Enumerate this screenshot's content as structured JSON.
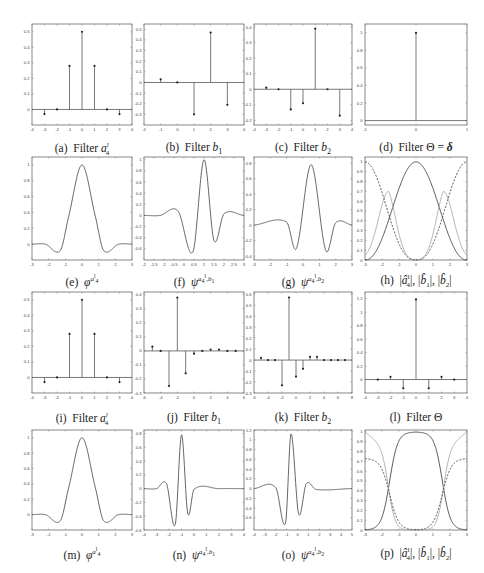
{
  "figure": {
    "panels": [
      {
        "id": "a",
        "caption": "(a) Filter a⁴ˡ",
        "caption_html": "(a)&nbsp; Filter <i>a</i><sup style='font-size:7px'><i>l</i></sup><sub style='font-size:7px;margin-left:-3px'>4</sub>"
      },
      {
        "id": "b",
        "caption": "(b) Filter b1",
        "caption_html": "(b)&nbsp; Filter <i>b</i><sub style='font-size:8px'>1</sub>"
      },
      {
        "id": "c",
        "caption": "(c) Filter b2",
        "caption_html": "(c)&nbsp; Filter <i>b</i><sub style='font-size:8px'>2</sub>"
      },
      {
        "id": "d",
        "caption": "(d) Filter Θ = δ",
        "caption_html": "(d)&nbsp; Filter &Theta; = <b><i>&delta;</i></b>"
      },
      {
        "id": "e",
        "caption": "(e) ϕ^{a_4^l}",
        "caption_html": "(e)&nbsp; <i>&phi;</i><sup style='font-size:7px'><i>a</i><sup>l</sup><sub>4</sub></sup>"
      },
      {
        "id": "f",
        "caption": "(f) ψ^{a_4^l, b_1}",
        "caption_html": "(f)&nbsp; <i>&psi;</i><sup style='font-size:7px'><i>a</i><sub>4</sub><sup>l</sup>,<i>b</i><sub>1</sub></sup>"
      },
      {
        "id": "g",
        "caption": "(g) ψ^{a_4^l, b_2}",
        "caption_html": "(g)&nbsp; <i>&psi;</i><sup style='font-size:7px'><i>a</i><sub>4</sub><sup>l</sup>,<i>b</i><sub>2</sub></sup>"
      },
      {
        "id": "h",
        "caption": "(h) |â_4^l|, |b̂_1|, |b̂_2|",
        "caption_html": "(h)&nbsp; |<i>a&#770;</i><sup style='font-size:7px'>l</sup><sub style='font-size:7px;margin-left:-3px'>4</sub>|, |<i>b&#770;</i><sub style='font-size:7px'>1</sub>|, |<i>b&#770;</i><sub style='font-size:7px'>2</sub>|"
      },
      {
        "id": "i",
        "caption": "(i) Filter a⁴ˡ",
        "caption_html": "(i)&nbsp; Filter <i>a</i><sup style='font-size:7px'><i>l</i></sup><sub style='font-size:7px;margin-left:-3px'>4</sub>"
      },
      {
        "id": "j",
        "caption": "(j) Filter b1",
        "caption_html": "(j)&nbsp; Filter <i>b</i><sub style='font-size:8px'>1</sub>"
      },
      {
        "id": "k",
        "caption": "(k) Filter b2",
        "caption_html": "(k)&nbsp; Filter <i>b</i><sub style='font-size:8px'>2</sub>"
      },
      {
        "id": "l",
        "caption": "(l) Filter Θ",
        "caption_html": "(l)&nbsp; Filter &Theta;"
      },
      {
        "id": "m",
        "caption": "(m) ϕ^{a_4^l}",
        "caption_html": "(m)&nbsp; <i>&phi;</i><sup style='font-size:7px'><i>a</i><sup>l</sup><sub>4</sub></sup>"
      },
      {
        "id": "n",
        "caption": "(n) ψ^{a_4^l, b_1}",
        "caption_html": "(n)&nbsp; <i>&psi;</i><sup style='font-size:7px'><i>a</i><sub>4</sub><sup>l</sup>,<i>b</i><sub>1</sub></sup>"
      },
      {
        "id": "o",
        "caption": "(o) ψ^{a_4^l, b_2}",
        "caption_html": "(o)&nbsp; <i>&psi;</i><sup style='font-size:7px'><i>a</i><sub>4</sub><sup>l</sup>,<i>b</i><sub>2</sub></sup>"
      },
      {
        "id": "p",
        "caption": "(p) |â_4^l|, |b̂_1|, |b̂_2|",
        "caption_html": "(p)&nbsp; |<i>a&#770;</i><sup style='font-size:7px'>l</sup><sub style='font-size:7px;margin-left:-3px'>4</sub>|, |<i>b&#770;</i><sub style='font-size:7px'>1</sub>|, |<i>b&#770;</i><sub style='font-size:7px'>2</sub>|"
      }
    ]
  },
  "chart_data": [
    {
      "id": "a",
      "type": "stem",
      "title": "Filter a_4^l",
      "x": [
        -3,
        -2,
        -1,
        0,
        1,
        2,
        3
      ],
      "values": [
        -0.03,
        0,
        0.28,
        0.5,
        0.28,
        0,
        -0.03
      ],
      "xlim": [
        -4,
        4
      ],
      "ylim": [
        -0.1,
        0.55
      ],
      "xticks": [
        -4,
        -3,
        -2,
        -1,
        0,
        1,
        2,
        3,
        4
      ],
      "yticks": [
        0,
        0.1,
        0.2,
        0.3,
        0.4,
        0.5
      ]
    },
    {
      "id": "b",
      "type": "stem",
      "title": "Filter b_1",
      "x": [
        -1,
        0,
        1,
        2,
        3
      ],
      "values": [
        0.03,
        0,
        -0.3,
        0.47,
        -0.21
      ],
      "xlim": [
        -2,
        4
      ],
      "ylim": [
        -0.4,
        0.55
      ],
      "xticks": [
        -2,
        -1,
        0,
        1,
        2,
        3,
        4
      ],
      "yticks": [
        -0.3,
        -0.2,
        -0.1,
        0,
        0.1,
        0.2,
        0.3,
        0.4,
        0.5
      ]
    },
    {
      "id": "c",
      "type": "stem",
      "title": "Filter b_2",
      "x": [
        -3,
        -2,
        -1,
        0,
        1,
        2,
        3
      ],
      "values": [
        0.01,
        0,
        -0.13,
        -0.09,
        0.39,
        0,
        -0.17
      ],
      "xlim": [
        -4,
        4
      ],
      "ylim": [
        -0.23,
        0.42
      ],
      "xticks": [
        -4,
        -3,
        -2,
        -1,
        0,
        1,
        2,
        3,
        4
      ],
      "yticks": [
        -0.2,
        -0.1,
        0,
        0.1,
        0.2,
        0.3,
        0.4
      ]
    },
    {
      "id": "d",
      "type": "stem",
      "title": "Filter Θ = δ",
      "x": [
        0
      ],
      "values": [
        1
      ],
      "xlim": [
        -1,
        1
      ],
      "ylim": [
        -0.05,
        1.1
      ],
      "xticks": [
        -1,
        0,
        1
      ],
      "yticks": [
        0,
        0.2,
        0.4,
        0.6,
        0.8,
        1
      ]
    },
    {
      "id": "e",
      "type": "line",
      "title": "ϕ^{a_4^l}",
      "xlim": [
        -3,
        3
      ],
      "ylim": [
        -0.2,
        1.1
      ],
      "xticks": [
        -3,
        -2,
        -1,
        0,
        1,
        2,
        3
      ],
      "yticks": [
        0,
        0.2,
        0.4,
        0.6,
        0.8,
        1
      ],
      "key_points": [
        [
          -3,
          0
        ],
        [
          -2.2,
          0
        ],
        [
          -1.3,
          -0.08
        ],
        [
          -0.8,
          0.35
        ],
        [
          0,
          1
        ],
        [
          0.8,
          0.35
        ],
        [
          1.3,
          -0.08
        ],
        [
          2.2,
          0
        ],
        [
          3,
          0
        ]
      ]
    },
    {
      "id": "f",
      "type": "line",
      "title": "ψ^{a_4^l,b_1}",
      "xlim": [
        -2,
        3
      ],
      "ylim": [
        -0.8,
        1.05
      ],
      "xticks": [
        -2,
        -1.5,
        -1,
        -0.5,
        0,
        0.5,
        1,
        1.5,
        2,
        2.5,
        3
      ],
      "yticks": [
        -0.6,
        -0.4,
        -0.2,
        0,
        0.2,
        0.4,
        0.6,
        0.8,
        1
      ],
      "key_points": [
        [
          -2,
          0
        ],
        [
          -1.2,
          0
        ],
        [
          -0.3,
          0.08
        ],
        [
          0.45,
          -0.65
        ],
        [
          1,
          1
        ],
        [
          1.5,
          -0.45
        ],
        [
          2,
          0.03
        ],
        [
          3,
          0
        ]
      ]
    },
    {
      "id": "g",
      "type": "line",
      "title": "ψ^{a_4^l,b_2}",
      "xlim": [
        -3,
        3
      ],
      "ylim": [
        -0.45,
        0.88
      ],
      "xticks": [
        -3,
        -2,
        -1,
        0,
        1,
        2,
        3
      ],
      "yticks": [
        -0.4,
        -0.2,
        0,
        0.2,
        0.4,
        0.6,
        0.8
      ],
      "key_points": [
        [
          -3,
          0
        ],
        [
          -1,
          0.04
        ],
        [
          -0.4,
          -0.3
        ],
        [
          0.5,
          0.78
        ],
        [
          1.4,
          -0.33
        ],
        [
          2,
          0.03
        ],
        [
          3,
          0
        ]
      ]
    },
    {
      "id": "h",
      "type": "line",
      "title": "|a_4^l|,|b_1|,|b_2|",
      "xlim": [
        -3,
        3
      ],
      "ylim": [
        0,
        1.05
      ],
      "xticks": [
        -3,
        -2,
        -1,
        0,
        1,
        2,
        3
      ],
      "yticks": [
        0,
        0.1,
        0.2,
        0.3,
        0.4,
        0.5,
        0.6,
        0.7,
        0.8,
        0.9,
        1
      ],
      "series": [
        {
          "name": "|a_4^l hat|",
          "style": "solid dark",
          "desc": "bell: 0 at ±3, 1 at 0"
        },
        {
          "name": "|b_1 hat|",
          "style": "solid light gray",
          "desc": "0.2 at ±3, peaks 0.7 at ±1.6, 0 at 0"
        },
        {
          "name": "|b_2 hat|",
          "style": "dashed",
          "desc": "1 at ±3, 0 at 0"
        }
      ]
    },
    {
      "id": "i",
      "type": "stem",
      "title": "Filter a_4^l",
      "x": [
        -3,
        -2,
        -1,
        0,
        1,
        2,
        3
      ],
      "values": [
        -0.03,
        0,
        0.28,
        0.5,
        0.28,
        0,
        -0.03
      ],
      "xlim": [
        -4,
        4
      ],
      "ylim": [
        -0.1,
        0.55
      ],
      "xticks": [
        -4,
        -3,
        -2,
        -1,
        0,
        1,
        2,
        3,
        4
      ],
      "yticks": [
        0,
        0.1,
        0.2,
        0.3,
        0.4,
        0.5
      ]
    },
    {
      "id": "j",
      "type": "stem",
      "title": "Filter b_1",
      "x": [
        -5,
        -4,
        -3,
        -2,
        -1,
        0,
        1,
        2,
        3,
        4,
        5
      ],
      "values": [
        0.03,
        0,
        -0.25,
        0.38,
        -0.16,
        -0.02,
        0,
        0.01,
        0.01,
        0,
        0
      ],
      "xlim": [
        -6,
        6
      ],
      "ylim": [
        -0.3,
        0.42
      ],
      "xticks": [
        -6,
        -4,
        -2,
        0,
        2,
        4,
        6
      ],
      "yticks": [
        -0.3,
        -0.2,
        -0.1,
        0,
        0.1,
        0.2,
        0.3,
        0.4
      ]
    },
    {
      "id": "k",
      "type": "stem",
      "title": "Filter b_2",
      "x": [
        -5,
        -4,
        -3,
        -2,
        -1,
        0,
        1,
        2,
        3,
        4,
        5,
        6,
        7
      ],
      "values": [
        0.02,
        0,
        0,
        -0.23,
        0.57,
        -0.15,
        -0.08,
        0.03,
        0.03,
        0,
        0,
        0,
        0
      ],
      "xlim": [
        -6,
        8
      ],
      "ylim": [
        -0.3,
        0.62
      ],
      "xticks": [
        -6,
        -4,
        -2,
        0,
        2,
        4,
        6,
        8
      ],
      "yticks": [
        -0.3,
        -0.2,
        -0.1,
        0,
        0.1,
        0.2,
        0.3,
        0.4,
        0.5,
        0.6
      ]
    },
    {
      "id": "l",
      "type": "stem",
      "title": "Filter Θ",
      "x": [
        -3,
        -2,
        -1,
        0,
        1,
        2,
        3
      ],
      "values": [
        0,
        0.04,
        -0.13,
        1.19,
        -0.13,
        0.04,
        0
      ],
      "xlim": [
        -4,
        4
      ],
      "ylim": [
        -0.2,
        1.3
      ],
      "xticks": [
        -4,
        -3,
        -2,
        -1,
        0,
        1,
        2,
        3,
        4
      ],
      "yticks": [
        0,
        0.2,
        0.4,
        0.6,
        0.8,
        1,
        1.2
      ]
    },
    {
      "id": "m",
      "type": "line",
      "title": "ϕ^{a_4^l}",
      "xlim": [
        -3,
        3
      ],
      "ylim": [
        -0.2,
        1.1
      ],
      "xticks": [
        -3,
        -2,
        -1,
        0,
        1,
        2,
        3
      ],
      "yticks": [
        0,
        0.2,
        0.4,
        0.6,
        0.8,
        1
      ],
      "key_points": [
        [
          -3,
          0
        ],
        [
          -2.2,
          0
        ],
        [
          -1.3,
          -0.08
        ],
        [
          -0.8,
          0.35
        ],
        [
          0,
          1
        ],
        [
          0.8,
          0.35
        ],
        [
          1.3,
          -0.08
        ],
        [
          2.2,
          0
        ],
        [
          3,
          0
        ]
      ]
    },
    {
      "id": "n",
      "type": "line",
      "title": "ψ^{a_4^l,b_1}",
      "xlim": [
        -4,
        4
      ],
      "ylim": [
        -0.6,
        0.85
      ],
      "xticks": [
        -4,
        -3,
        -2,
        -1,
        0,
        1,
        2,
        3,
        4
      ],
      "yticks": [
        -0.6,
        -0.4,
        -0.2,
        0,
        0.2,
        0.4,
        0.6,
        0.8
      ],
      "key_points": [
        [
          -4,
          0
        ],
        [
          -3,
          0
        ],
        [
          -2.2,
          0.07
        ],
        [
          -1.5,
          -0.52
        ],
        [
          -1,
          0.78
        ],
        [
          -0.5,
          -0.36
        ],
        [
          0,
          -0.01
        ],
        [
          2,
          0
        ],
        [
          4,
          0
        ]
      ]
    },
    {
      "id": "o",
      "type": "line",
      "title": "ψ^{a_4^l,b_2}",
      "xlim": [
        -4,
        5
      ],
      "ylim": [
        -0.85,
        1.2
      ],
      "xticks": [
        -4,
        -3,
        -2,
        -1,
        0,
        1,
        2,
        3,
        4,
        5
      ],
      "yticks": [
        -0.6,
        -0.4,
        -0.2,
        0,
        0.2,
        0.4,
        0.6,
        0.8,
        1,
        1.2
      ],
      "key_points": [
        [
          -4,
          0
        ],
        [
          -2,
          0.02
        ],
        [
          -1.1,
          -0.7
        ],
        [
          -0.6,
          1.12
        ],
        [
          0.1,
          -0.52
        ],
        [
          0.8,
          0.1
        ],
        [
          1.7,
          -0.02
        ],
        [
          5,
          0
        ]
      ]
    },
    {
      "id": "p",
      "type": "line",
      "title": "|a_4^l|,|b_1|,|b_2|",
      "xlim": [
        -3,
        3
      ],
      "ylim": [
        0,
        1.02
      ],
      "xticks": [
        -3,
        -2,
        -1,
        0,
        1,
        2,
        3
      ],
      "yticks": [
        0,
        0.1,
        0.2,
        0.3,
        0.4,
        0.5,
        0.6,
        0.7,
        0.8,
        0.9,
        1
      ],
      "series": [
        {
          "name": "|a_4^l hat|",
          "style": "solid dark",
          "desc": "flat-top: 1 on [-0.6,0.6], 0 at ±3"
        },
        {
          "name": "|b_1 hat|",
          "style": "solid light gray",
          "desc": "1 at ±3, 0 on [-0.8,0.8]"
        },
        {
          "name": "|b_2 hat|",
          "style": "dashed",
          "desc": "0.73 at ±3, 0 near 0"
        }
      ]
    }
  ]
}
